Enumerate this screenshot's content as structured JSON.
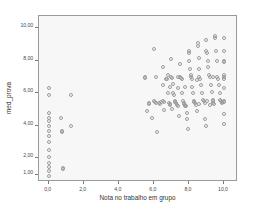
{
  "chart_data": {
    "type": "scatter",
    "title": "",
    "xlabel": "Nota no trabalho em grupo",
    "ylabel": "med_prova",
    "xlim": [
      -0.55,
      10.8
    ],
    "ylim": [
      0.55,
      10.75
    ],
    "xticks": [
      "0,0",
      "2,0",
      "4,0",
      "6,0",
      "8,0",
      "10,0"
    ],
    "xtickvalues": [
      0,
      2,
      4,
      6,
      8,
      10
    ],
    "yticks": [
      "10,00",
      "8,00",
      "6,00",
      "4,00",
      "2,00",
      "1,00"
    ],
    "ytickvalues": [
      10,
      8,
      6,
      4,
      2,
      1
    ],
    "grid": false,
    "legend": null,
    "marker": "open-circle",
    "marker_color": "#9b9b9b",
    "plot_background": "#f7f7f7",
    "frame_color": "#9a9a9a",
    "points": [
      [
        0.0,
        6.3
      ],
      [
        0.0,
        5.9
      ],
      [
        0.0,
        4.8
      ],
      [
        0.0,
        4.5
      ],
      [
        0.0,
        4.3
      ],
      [
        0.0,
        4.0
      ],
      [
        0.0,
        3.7
      ],
      [
        0.0,
        3.4
      ],
      [
        0.0,
        3.0
      ],
      [
        0.0,
        2.5
      ],
      [
        0.0,
        2.1
      ],
      [
        0.0,
        1.7
      ],
      [
        0.0,
        1.5
      ],
      [
        0.0,
        1.2
      ],
      [
        0.0,
        0.9
      ],
      [
        0.7,
        4.5
      ],
      [
        0.75,
        3.7
      ],
      [
        0.75,
        3.6
      ],
      [
        0.8,
        1.4
      ],
      [
        0.8,
        1.35
      ],
      [
        1.3,
        5.9
      ],
      [
        1.3,
        4.0
      ],
      [
        5.5,
        7.0
      ],
      [
        5.5,
        6.95
      ],
      [
        5.6,
        4.9
      ],
      [
        5.7,
        5.4
      ],
      [
        5.75,
        5.35
      ],
      [
        5.9,
        4.5
      ],
      [
        6.0,
        8.7
      ],
      [
        6.0,
        5.5
      ],
      [
        6.05,
        5.45
      ],
      [
        6.1,
        7.0
      ],
      [
        6.1,
        5.4
      ],
      [
        6.2,
        3.6
      ],
      [
        6.3,
        5.4
      ],
      [
        6.35,
        5.35
      ],
      [
        6.5,
        7.6
      ],
      [
        6.5,
        6.5
      ],
      [
        6.55,
        5.5
      ],
      [
        6.6,
        5.45
      ],
      [
        6.6,
        5.0
      ],
      [
        6.7,
        6.9
      ],
      [
        6.75,
        6.85
      ],
      [
        6.8,
        7.1
      ],
      [
        6.8,
        6.0
      ],
      [
        6.85,
        5.4
      ],
      [
        6.9,
        5.35
      ],
      [
        6.95,
        5.3
      ],
      [
        7.0,
        8.1
      ],
      [
        7.0,
        7.0
      ],
      [
        7.05,
        6.95
      ],
      [
        7.1,
        6.6
      ],
      [
        7.1,
        6.0
      ],
      [
        7.15,
        5.9
      ],
      [
        7.2,
        5.5
      ],
      [
        7.2,
        5.45
      ],
      [
        7.25,
        5.4
      ],
      [
        7.3,
        5.3
      ],
      [
        7.35,
        5.25
      ],
      [
        7.4,
        6.3
      ],
      [
        7.45,
        4.6
      ],
      [
        7.5,
        7.8
      ],
      [
        7.5,
        7.0
      ],
      [
        7.55,
        6.95
      ],
      [
        7.6,
        6.9
      ],
      [
        7.6,
        6.0
      ],
      [
        7.65,
        5.5
      ],
      [
        7.7,
        5.4
      ],
      [
        7.7,
        5.35
      ],
      [
        7.75,
        5.3
      ],
      [
        7.8,
        5.25
      ],
      [
        7.85,
        5.2
      ],
      [
        7.9,
        4.8
      ],
      [
        7.9,
        4.4
      ],
      [
        7.95,
        3.8
      ],
      [
        8.0,
        8.6
      ],
      [
        8.0,
        8.5
      ],
      [
        8.0,
        8.0
      ],
      [
        8.05,
        7.5
      ],
      [
        8.1,
        7.1
      ],
      [
        8.1,
        7.0
      ],
      [
        8.15,
        6.9
      ],
      [
        8.2,
        6.4
      ],
      [
        8.25,
        6.0
      ],
      [
        8.3,
        5.5
      ],
      [
        8.3,
        5.45
      ],
      [
        8.35,
        5.4
      ],
      [
        8.4,
        5.3
      ],
      [
        8.45,
        4.9
      ],
      [
        8.5,
        9.1
      ],
      [
        8.5,
        8.9
      ],
      [
        8.55,
        8.2
      ],
      [
        8.6,
        7.5
      ],
      [
        8.6,
        7.0
      ],
      [
        8.65,
        6.9
      ],
      [
        8.7,
        6.5
      ],
      [
        8.75,
        6.0
      ],
      [
        8.8,
        5.6
      ],
      [
        8.85,
        5.5
      ],
      [
        8.9,
        5.4
      ],
      [
        8.9,
        4.4
      ],
      [
        8.95,
        4.0
      ],
      [
        9.0,
        9.3
      ],
      [
        9.0,
        8.6
      ],
      [
        9.05,
        8.5
      ],
      [
        9.1,
        8.0
      ],
      [
        9.1,
        7.6
      ],
      [
        9.15,
        7.1
      ],
      [
        9.2,
        7.0
      ],
      [
        9.25,
        6.5
      ],
      [
        9.3,
        6.1
      ],
      [
        9.35,
        5.6
      ],
      [
        9.4,
        5.5
      ],
      [
        9.4,
        5.4
      ],
      [
        9.45,
        5.35
      ],
      [
        9.5,
        9.5
      ],
      [
        9.5,
        9.4
      ],
      [
        9.55,
        8.6
      ],
      [
        9.6,
        8.0
      ],
      [
        9.6,
        7.0
      ],
      [
        9.65,
        6.9
      ],
      [
        9.7,
        6.5
      ],
      [
        9.75,
        6.0
      ],
      [
        9.8,
        5.6
      ],
      [
        9.85,
        5.5
      ],
      [
        9.9,
        5.45
      ],
      [
        9.9,
        5.4
      ],
      [
        10.0,
        9.4
      ],
      [
        10.0,
        8.6
      ],
      [
        10.0,
        8.0
      ],
      [
        10.0,
        7.95
      ],
      [
        10.0,
        7.1
      ],
      [
        10.0,
        7.0
      ],
      [
        10.0,
        6.9
      ],
      [
        10.0,
        6.3
      ],
      [
        10.0,
        5.5
      ],
      [
        10.0,
        5.45
      ],
      [
        10.0,
        4.7
      ],
      [
        10.0,
        4.1
      ],
      [
        6.4,
        5.45
      ],
      [
        7.05,
        5.05
      ],
      [
        8.6,
        5.35
      ],
      [
        9.2,
        5.3
      ],
      [
        9.05,
        5.5
      ],
      [
        7.8,
        6.4
      ],
      [
        8.45,
        6.8
      ],
      [
        9.35,
        7.0
      ],
      [
        6.9,
        6.4
      ],
      [
        7.35,
        7.0
      ]
    ]
  }
}
